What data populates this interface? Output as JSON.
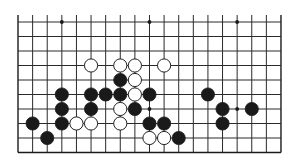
{
  "board": {
    "title": "Go board diagram (partial, top edge open)",
    "columns": 19,
    "rows": 10,
    "origin_x": 18,
    "origin_y": 22,
    "spacing_x": 14.61,
    "spacing_y": 14.5,
    "line_extension_top": 7,
    "line_color": "#2a2a2a",
    "border_color": "#1a1a1a",
    "background": "#ffffff",
    "stone_radius": 6.6,
    "black_fill": "#1a1a1a",
    "white_fill": "#ffffff",
    "white_stroke": "#222222",
    "star_points": [
      {
        "col": 3,
        "row": 0
      },
      {
        "col": 9,
        "row": 0
      },
      {
        "col": 15,
        "row": 0
      },
      {
        "col": 3,
        "row": 6
      },
      {
        "col": 9,
        "row": 6
      },
      {
        "col": 15,
        "row": 6
      }
    ],
    "stones": [
      {
        "col": 5,
        "row": 3,
        "color": "white"
      },
      {
        "col": 7,
        "row": 3,
        "color": "white"
      },
      {
        "col": 8,
        "row": 3,
        "color": "white"
      },
      {
        "col": 10,
        "row": 3,
        "color": "white"
      },
      {
        "col": 7,
        "row": 4,
        "color": "black"
      },
      {
        "col": 8,
        "row": 4,
        "color": "white"
      },
      {
        "col": 3,
        "row": 5,
        "color": "black"
      },
      {
        "col": 5,
        "row": 5,
        "color": "black"
      },
      {
        "col": 6,
        "row": 5,
        "color": "black"
      },
      {
        "col": 7,
        "row": 5,
        "color": "black"
      },
      {
        "col": 8,
        "row": 5,
        "color": "white"
      },
      {
        "col": 9,
        "row": 5,
        "color": "black"
      },
      {
        "col": 13,
        "row": 5,
        "color": "black"
      },
      {
        "col": 3,
        "row": 6,
        "color": "black"
      },
      {
        "col": 5,
        "row": 6,
        "color": "black"
      },
      {
        "col": 7,
        "row": 6,
        "color": "white"
      },
      {
        "col": 8,
        "row": 6,
        "color": "black"
      },
      {
        "col": 14,
        "row": 6,
        "color": "black"
      },
      {
        "col": 16,
        "row": 6,
        "color": "black"
      },
      {
        "col": 1,
        "row": 7,
        "color": "black"
      },
      {
        "col": 3,
        "row": 7,
        "color": "black"
      },
      {
        "col": 4,
        "row": 7,
        "color": "white"
      },
      {
        "col": 5,
        "row": 7,
        "color": "white"
      },
      {
        "col": 7,
        "row": 7,
        "color": "white"
      },
      {
        "col": 9,
        "row": 7,
        "color": "black"
      },
      {
        "col": 10,
        "row": 7,
        "color": "black"
      },
      {
        "col": 14,
        "row": 7,
        "color": "black"
      },
      {
        "col": 2,
        "row": 8,
        "color": "black"
      },
      {
        "col": 9,
        "row": 8,
        "color": "white"
      },
      {
        "col": 10,
        "row": 8,
        "color": "white"
      },
      {
        "col": 11,
        "row": 8,
        "color": "black"
      }
    ]
  }
}
